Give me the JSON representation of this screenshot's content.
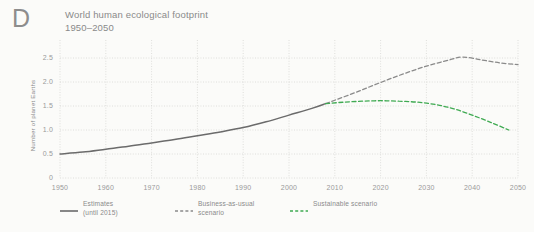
{
  "panel": {
    "letter": "D"
  },
  "header": {
    "title_line1": "World human ecological footprint",
    "title_line2": "1950–2050"
  },
  "axes": {
    "ylabel": "Number of planet Earths",
    "yticks": [
      "0",
      "0.5",
      "1.0",
      "1.5",
      "2.0",
      "2.5"
    ],
    "xticks": [
      "1950",
      "1960",
      "1970",
      "1980",
      "1990",
      "2000",
      "2010",
      "2020",
      "2030",
      "2040",
      "2050"
    ]
  },
  "legend": {
    "items": [
      {
        "label_line1": "Estimates",
        "label_line2": "(until 2015)",
        "style": "solid",
        "color": "#6b6b6b"
      },
      {
        "label_line1": "Business-as-usual",
        "label_line2": "scenario",
        "style": "dashed",
        "color": "#8a8a8a"
      },
      {
        "label_line1": "Sustainable scenario",
        "label_line2": "",
        "style": "dashed",
        "color": "#4caf50"
      }
    ]
  },
  "colors": {
    "background": "#fbfbf9",
    "grid": "#d8d8d4",
    "estimates": "#6b6b6b",
    "business_as_usual": "#8a8a8a",
    "sustainable": "#3faa52",
    "text": "#8a8a8a"
  },
  "chart_data": {
    "type": "line",
    "title": "World human ecological footprint 1950–2050",
    "xlabel": "",
    "ylabel": "Number of planet Earths",
    "xlim": [
      1950,
      2050
    ],
    "ylim": [
      0,
      2.75
    ],
    "grid": true,
    "legend_position": "below",
    "series": [
      {
        "name": "Estimates (until 2015)",
        "style": "solid",
        "color": "#6b6b6b",
        "x": [
          1950,
          1955,
          1960,
          1965,
          1970,
          1975,
          1980,
          1985,
          1990,
          1995,
          2000,
          2005,
          2008
        ],
        "values": [
          0.5,
          0.54,
          0.6,
          0.66,
          0.73,
          0.8,
          0.88,
          0.96,
          1.05,
          1.17,
          1.31,
          1.45,
          1.55
        ]
      },
      {
        "name": "Business-as-usual scenario",
        "style": "dashed",
        "color": "#8a8a8a",
        "x": [
          2008,
          2010,
          2015,
          2020,
          2025,
          2030,
          2035,
          2038,
          2042,
          2046,
          2050
        ],
        "values": [
          1.55,
          1.62,
          1.8,
          1.99,
          2.17,
          2.33,
          2.46,
          2.52,
          2.46,
          2.4,
          2.36
        ]
      },
      {
        "name": "Sustainable scenario",
        "style": "dashed",
        "color": "#3faa52",
        "x": [
          2008,
          2012,
          2016,
          2020,
          2024,
          2028,
          2032,
          2036,
          2040,
          2044,
          2048
        ],
        "values": [
          1.55,
          1.58,
          1.6,
          1.61,
          1.6,
          1.58,
          1.53,
          1.44,
          1.31,
          1.16,
          1.0
        ]
      }
    ]
  }
}
